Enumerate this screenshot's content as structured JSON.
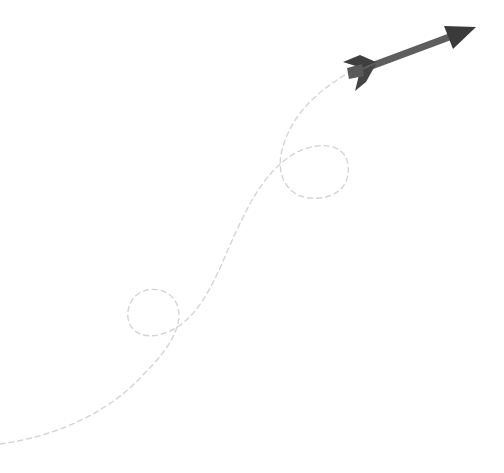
{
  "illustration": {
    "subject": "arrow-with-dashed-looping-trail",
    "background": "#ffffff",
    "colors": {
      "trail": "#d4d4d4",
      "shaft": "#5e5e5e",
      "head": "#3a3a3a",
      "fletch_dark": "#3f3f3f",
      "fletch_light": "#5a5a5a"
    }
  }
}
